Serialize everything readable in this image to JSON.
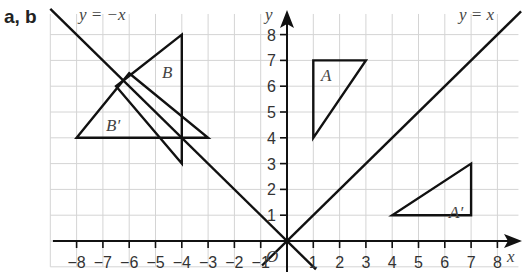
{
  "part_label": "a, b",
  "chart_data": {
    "type": "scatter",
    "title": "",
    "xlabel": "x",
    "ylabel": "y",
    "xlim": [
      -9,
      9
    ],
    "ylim": [
      -1,
      9
    ],
    "grid": true,
    "x_ticks": [
      -8,
      -7,
      -6,
      -5,
      -4,
      -3,
      -2,
      -1,
      1,
      2,
      3,
      4,
      5,
      6,
      7,
      8
    ],
    "y_ticks": [
      1,
      2,
      3,
      4,
      5,
      6,
      7,
      8
    ],
    "origin_label": "O",
    "lines": [
      {
        "name": "y = -x",
        "label": "y = −x"
      },
      {
        "name": "y = x",
        "label": "y = x"
      }
    ],
    "shapes": [
      {
        "name": "A",
        "label": "A",
        "vertices": [
          [
            1,
            4
          ],
          [
            1,
            7
          ],
          [
            3,
            7
          ]
        ]
      },
      {
        "name": "A'",
        "label": "A′",
        "vertices": [
          [
            4,
            1
          ],
          [
            7,
            1
          ],
          [
            7,
            3
          ]
        ]
      },
      {
        "name": "B",
        "label": "B",
        "vertices": [
          [
            -4,
            3
          ],
          [
            -4,
            8
          ],
          [
            -6.5,
            6
          ]
        ]
      },
      {
        "name": "B'",
        "label": "B′",
        "vertices": [
          [
            -3,
            4
          ],
          [
            -8,
            4
          ],
          [
            -6,
            6.5
          ]
        ]
      }
    ]
  },
  "labels": {
    "x_axis": "x",
    "y_axis": "y",
    "line_neg": "y = −x",
    "line_pos": "y = x",
    "A": "A",
    "A_prime": "A′",
    "B": "B",
    "B_prime": "B′",
    "origin": "O",
    "xt": [
      "−8",
      "−7",
      "−6",
      "−5",
      "−4",
      "−3",
      "−2",
      "−1",
      "1",
      "2",
      "3",
      "4",
      "5",
      "6",
      "7",
      "8"
    ],
    "yt": [
      "1",
      "2",
      "3",
      "4",
      "5",
      "6",
      "7",
      "8"
    ]
  }
}
